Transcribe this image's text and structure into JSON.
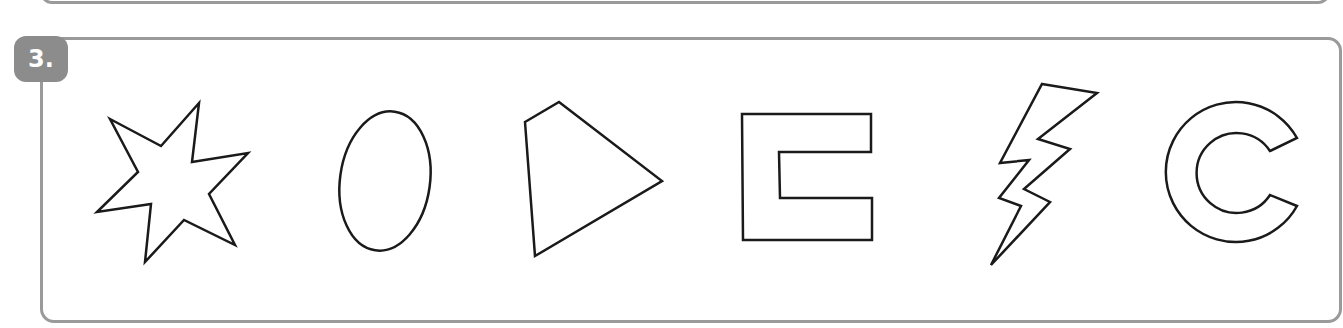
{
  "exercise": {
    "number_label": "3.",
    "badge_color": "#8c8c8c",
    "border_color": "#9a9a9a",
    "outline_color": "#1a1a1a",
    "shapes": [
      {
        "name": "seven-point-star"
      },
      {
        "name": "ellipse"
      },
      {
        "name": "quadrilateral"
      },
      {
        "name": "bracket-u-shape"
      },
      {
        "name": "lightning-bolt"
      },
      {
        "name": "c-shape"
      }
    ]
  }
}
